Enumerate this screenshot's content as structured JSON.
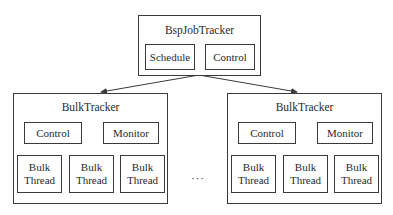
{
  "job_tracker": {
    "title": "BspJobTracker",
    "components": [
      "Schedule",
      "Control"
    ]
  },
  "bulk_trackers": [
    {
      "title": "BulkTracker",
      "components": [
        "Control",
        "Monitor"
      ],
      "threads": [
        {
          "line1": "Bulk",
          "line2": "Thread"
        },
        {
          "line1": "Bulk",
          "line2": "Thread"
        },
        {
          "line1": "Bulk",
          "line2": "Thread"
        }
      ]
    },
    {
      "title": "BulkTracker",
      "components": [
        "Control",
        "Monitor"
      ],
      "threads": [
        {
          "line1": "Bulk",
          "line2": "Thread"
        },
        {
          "line1": "Bulk",
          "line2": "Thread"
        },
        {
          "line1": "Bulk",
          "line2": "Thread"
        }
      ]
    }
  ],
  "ellipsis": "···",
  "colors": {
    "stroke": "#3a3a3a",
    "text": "#2a2a2a",
    "background": "#ffffff"
  }
}
